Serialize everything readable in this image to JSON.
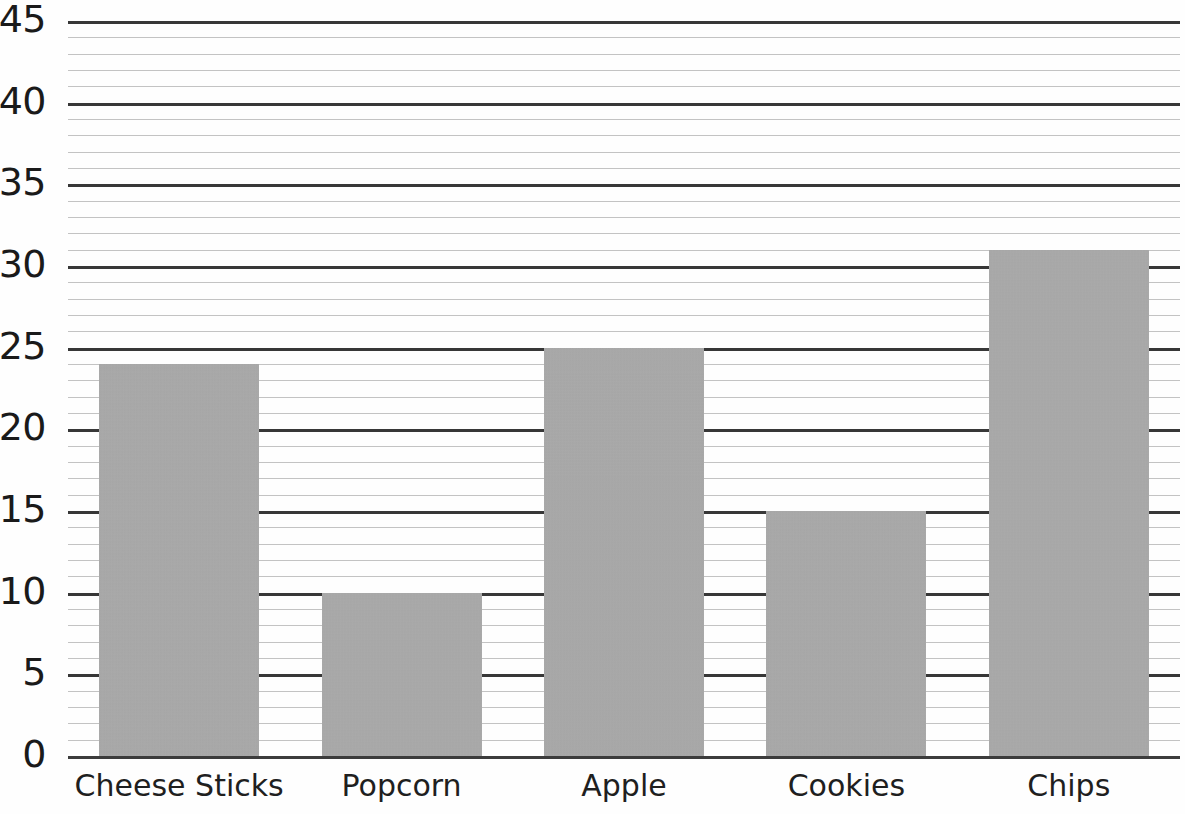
{
  "chart_data": {
    "type": "bar",
    "title": "",
    "subtitle": "",
    "xlabel": "",
    "ylabel": "",
    "categories": [
      "Cheese Sticks",
      "Popcorn",
      "Apple",
      "Cookies",
      "Chips"
    ],
    "values": [
      24,
      10,
      25,
      15,
      31
    ],
    "series": [
      {
        "name": "",
        "values": [
          24,
          10,
          25,
          15,
          31
        ]
      }
    ],
    "ylim": [
      0,
      45
    ],
    "xlim": [
      0,
      5
    ],
    "y_major_ticks": [
      0,
      5,
      10,
      15,
      20,
      25,
      30,
      35,
      40,
      45
    ],
    "y_tick_labels": [
      "0",
      "5",
      "10",
      "15",
      "20",
      "25",
      "30",
      "35",
      "40",
      "45"
    ],
    "y_minor_tick_interval": 1,
    "grid": {
      "horizontal_major": true,
      "horizontal_minor": true,
      "vertical": false,
      "major_color": "#262626",
      "minor_color": "#b9b9b9"
    },
    "legend": {
      "visible": false,
      "position": "none",
      "entries": []
    },
    "bar_color": "#ababab",
    "background_color": "#ffffff",
    "text_color": "#1a1a1a",
    "annotations": [],
    "data_labels_visible": false
  },
  "axis": {
    "y_labels": [
      "45",
      "40",
      "35",
      "30",
      "25",
      "20",
      "15",
      "10",
      "5",
      "0"
    ],
    "x_labels": [
      "Cheese Sticks",
      "Popcorn",
      "Apple",
      "Cookies",
      "Chips"
    ]
  }
}
